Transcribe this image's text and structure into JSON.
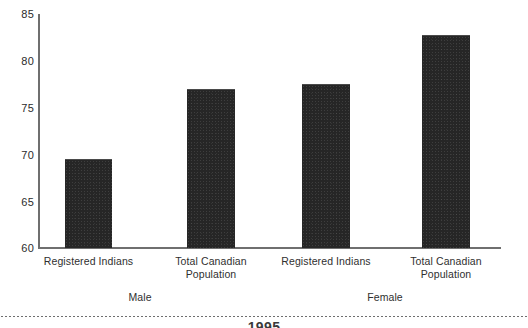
{
  "chart_data": {
    "type": "bar",
    "title": "",
    "subtitle": "",
    "xlabel": "",
    "ylabel": "",
    "ylim": [
      60,
      85
    ],
    "yticks": [
      60,
      65,
      70,
      75,
      80,
      85
    ],
    "grid": false,
    "legend": null,
    "categories": [
      "Registered Indians",
      "Total Canadian Population",
      "Registered Indians",
      "Total Canadian Population"
    ],
    "values": [
      69.4,
      77.0,
      77.5,
      82.8
    ],
    "groups": [
      "Male",
      "Female"
    ],
    "bar_color": "#262626",
    "axis_color": "#6f6f6f"
  },
  "axis": {
    "tick_labels": [
      "85",
      "80",
      "75",
      "70",
      "65",
      "60"
    ]
  },
  "categories": {
    "bar1_line1": "Registered Indians",
    "bar1_line2": "",
    "bar2_line1": "Total Canadian",
    "bar2_line2": "Population",
    "bar3_line1": "Registered Indians",
    "bar3_line2": "",
    "bar4_line1": "Total Canadian",
    "bar4_line2": "Population"
  },
  "groups": {
    "male": "Male",
    "female": "Female"
  },
  "footer": {
    "cut_caption": "1995"
  }
}
